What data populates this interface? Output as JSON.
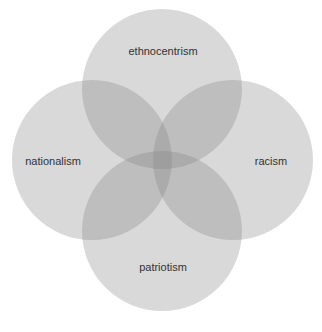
{
  "diagram": {
    "type": "venn",
    "sets": [
      {
        "id": "ethnocentrism",
        "label": "ethnocentrism",
        "position": "top"
      },
      {
        "id": "nationalism",
        "label": "nationalism",
        "position": "left"
      },
      {
        "id": "racism",
        "label": "racism",
        "position": "right"
      },
      {
        "id": "patriotism",
        "label": "patriotism",
        "position": "bottom"
      }
    ],
    "colors": {
      "background": "#ffffff",
      "circle_fill": "#808080",
      "label_text": "#333333"
    }
  }
}
